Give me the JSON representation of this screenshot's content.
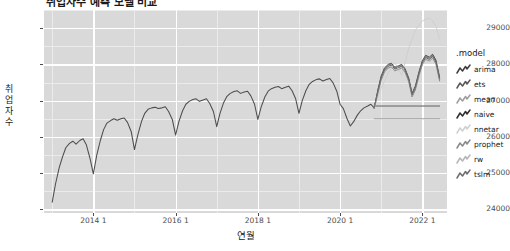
{
  "chart_data": {
    "type": "line",
    "title": "취업자수 예측 모델 비교",
    "xlabel": "연월",
    "ylabel": "취업자수",
    "ylim": [
      23900,
      29500
    ],
    "xlim": [
      2012.8,
      2022.6
    ],
    "yticks": [
      24000,
      25000,
      26000,
      27000,
      28000,
      29000
    ],
    "ytick_labels": [
      "24000",
      "25000",
      "26000",
      "27000",
      "28000",
      "29000"
    ],
    "xticks": [
      2014,
      2016,
      2018,
      2020,
      2022
    ],
    "xtick_labels": [
      "2014 1",
      "2016 1",
      "2018 1",
      "2020 1",
      "2022 1"
    ],
    "grid": true,
    "legend_position": "right",
    "legend_title": ".model",
    "panel_bg": "#d9d9d9",
    "grid_color": "#ffffff",
    "forecast_start": 2020.83,
    "series": [
      {
        "name": "historical",
        "legend": false,
        "color": "#4d4d4d",
        "x": [
          2013.0,
          2013.08,
          2013.17,
          2013.25,
          2013.33,
          2013.42,
          2013.5,
          2013.58,
          2013.67,
          2013.75,
          2013.83,
          2013.92,
          2014.0,
          2014.08,
          2014.17,
          2014.25,
          2014.33,
          2014.42,
          2014.5,
          2014.58,
          2014.67,
          2014.75,
          2014.83,
          2014.92,
          2015.0,
          2015.08,
          2015.17,
          2015.25,
          2015.33,
          2015.42,
          2015.5,
          2015.58,
          2015.67,
          2015.75,
          2015.83,
          2015.92,
          2016.0,
          2016.08,
          2016.17,
          2016.25,
          2016.33,
          2016.42,
          2016.5,
          2016.58,
          2016.67,
          2016.75,
          2016.83,
          2016.92,
          2017.0,
          2017.08,
          2017.17,
          2017.25,
          2017.33,
          2017.42,
          2017.5,
          2017.58,
          2017.67,
          2017.75,
          2017.83,
          2017.92,
          2018.0,
          2018.08,
          2018.17,
          2018.25,
          2018.33,
          2018.42,
          2018.5,
          2018.58,
          2018.67,
          2018.75,
          2018.83,
          2018.92,
          2019.0,
          2019.08,
          2019.17,
          2019.25,
          2019.33,
          2019.42,
          2019.5,
          2019.58,
          2019.67,
          2019.75,
          2019.83,
          2019.92,
          2020.0,
          2020.08,
          2020.17,
          2020.25,
          2020.33,
          2020.42,
          2020.5,
          2020.58,
          2020.67,
          2020.75,
          2020.83
        ],
        "values": [
          24200,
          24700,
          25150,
          25450,
          25700,
          25820,
          25880,
          25800,
          25900,
          25950,
          25780,
          25400,
          24980,
          25480,
          25900,
          26200,
          26380,
          26450,
          26500,
          26460,
          26500,
          26520,
          26400,
          26150,
          25650,
          26050,
          26420,
          26650,
          26760,
          26800,
          26820,
          26780,
          26800,
          26830,
          26700,
          26480,
          26050,
          26420,
          26720,
          26900,
          26980,
          27030,
          27050,
          26980,
          27020,
          27050,
          26920,
          26700,
          26280,
          26650,
          26950,
          27120,
          27200,
          27250,
          27270,
          27200,
          27240,
          27260,
          27130,
          26900,
          26480,
          26820,
          27100,
          27260,
          27330,
          27370,
          27390,
          27330,
          27370,
          27400,
          27280,
          27050,
          26650,
          27000,
          27280,
          27450,
          27530,
          27580,
          27600,
          27540,
          27580,
          27610,
          27490,
          27260,
          26900,
          26780,
          26500,
          26300,
          26420,
          26600,
          26720,
          26800,
          26850,
          26900,
          26800
        ]
      },
      {
        "name": "arima",
        "legend": true,
        "color": "#3d3d3d",
        "key_shade": "#3d3d3d",
        "x": [
          2020.83,
          2020.92,
          2021.0,
          2021.08,
          2021.17,
          2021.25,
          2021.33,
          2021.42,
          2021.5,
          2021.58,
          2021.67,
          2021.75,
          2021.83,
          2021.92,
          2022.0,
          2022.08,
          2022.17,
          2022.25,
          2022.33,
          2022.42
        ],
        "values": [
          26800,
          27300,
          27680,
          27900,
          28000,
          28030,
          27920,
          27960,
          28000,
          27880,
          27620,
          27200,
          27400,
          27800,
          28100,
          28250,
          28200,
          28280,
          28120,
          27650
        ]
      },
      {
        "name": "ets",
        "legend": true,
        "color": "#575757",
        "key_shade": "#575757",
        "x": [
          2020.83,
          2020.92,
          2021.0,
          2021.08,
          2021.17,
          2021.25,
          2021.33,
          2021.42,
          2021.5,
          2021.58,
          2021.67,
          2021.75,
          2021.83,
          2021.92,
          2022.0,
          2022.08,
          2022.17,
          2022.25,
          2022.33,
          2022.42
        ],
        "values": [
          26800,
          27250,
          27620,
          27840,
          27950,
          27980,
          27870,
          27910,
          27950,
          27830,
          27570,
          27150,
          27340,
          27740,
          28040,
          28190,
          28140,
          28220,
          28060,
          27590
        ]
      },
      {
        "name": "mean",
        "legend": true,
        "color": "#9e9e9e",
        "key_shade": "#9e9e9e",
        "x": [
          2020.83,
          2022.42
        ],
        "values": [
          26500,
          26500
        ]
      },
      {
        "name": "naive",
        "legend": true,
        "color": "#2e2e2e",
        "key_shade": "#2e2e2e",
        "x": [
          2020.83,
          2022.42
        ],
        "values": [
          26850,
          26850
        ]
      },
      {
        "name": "nnetar",
        "legend": true,
        "color": "#cfcfcf",
        "key_shade": "#cfcfcf",
        "x": [
          2020.83,
          2021.0,
          2021.17,
          2021.33,
          2021.5,
          2021.67,
          2021.83,
          2022.0,
          2022.17,
          2022.25,
          2022.33,
          2022.42
        ],
        "values": [
          26800,
          27350,
          27750,
          28050,
          27700,
          28450,
          28950,
          29200,
          29280,
          29200,
          29050,
          28700
        ]
      },
      {
        "name": "prophet",
        "legend": true,
        "color": "#8a8a8a",
        "key_shade": "#8a8a8a",
        "x": [
          2020.83,
          2020.92,
          2021.0,
          2021.08,
          2021.17,
          2021.25,
          2021.33,
          2021.42,
          2021.5,
          2021.58,
          2021.67,
          2021.75,
          2021.83,
          2021.92,
          2022.0,
          2022.08,
          2022.17,
          2022.25,
          2022.33,
          2022.42
        ],
        "values": [
          26800,
          27200,
          27560,
          27790,
          27900,
          27930,
          27820,
          27860,
          27900,
          27780,
          27520,
          27100,
          27290,
          27690,
          27990,
          28140,
          28090,
          28170,
          28010,
          27540
        ]
      },
      {
        "name": "rw",
        "legend": true,
        "color": "#b5b5b5",
        "key_shade": "#b5b5b5",
        "x": [
          2020.83,
          2022.42
        ],
        "values": [
          26850,
          26850
        ]
      },
      {
        "name": "tslm",
        "legend": true,
        "color": "#6e6e6e",
        "key_shade": "#6e6e6e",
        "x": [
          2020.83,
          2020.92,
          2021.0,
          2021.08,
          2021.17,
          2021.25,
          2021.33,
          2021.42,
          2021.5,
          2021.58,
          2021.67,
          2021.75,
          2021.83,
          2021.92,
          2022.0,
          2022.08,
          2022.17,
          2022.25,
          2022.33,
          2022.42
        ],
        "values": [
          26800,
          27280,
          27650,
          27870,
          27980,
          28010,
          27900,
          27940,
          27980,
          27860,
          27600,
          27180,
          27370,
          27770,
          28070,
          28220,
          28170,
          28250,
          28090,
          27620
        ]
      }
    ],
    "legend_entries": [
      {
        "label": "arima",
        "color": "#3d3d3d"
      },
      {
        "label": "ets",
        "color": "#575757"
      },
      {
        "label": "mean",
        "color": "#9e9e9e"
      },
      {
        "label": "naive",
        "color": "#2e2e2e"
      },
      {
        "label": "nnetar",
        "color": "#cfcfcf"
      },
      {
        "label": "prophet",
        "color": "#8a8a8a"
      },
      {
        "label": "rw",
        "color": "#b5b5b5"
      },
      {
        "label": "tslm",
        "color": "#6e6e6e"
      }
    ]
  }
}
